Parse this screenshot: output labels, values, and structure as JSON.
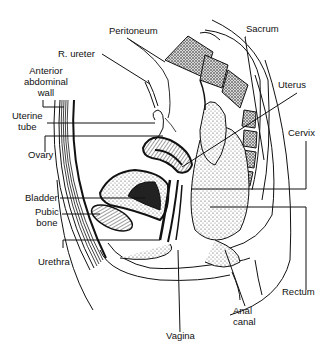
{
  "diagram": {
    "labels": {
      "peritoneum": "Peritoneum",
      "r_ureter": "R. ureter",
      "sacrum": "Sacrum",
      "anterior_abdominal_wall": [
        "Anterior",
        "abdominal",
        "wall"
      ],
      "uterus": "Uterus",
      "uterine_tube": [
        "Uterine",
        "tube"
      ],
      "cervix": "Cervix",
      "ovary": "Ovary",
      "bladder": "Bladder",
      "pubic_bone": [
        "Pubic",
        "bone"
      ],
      "urethra": "Urethra",
      "rectum": "Rectum",
      "anal_canal": [
        "Anal",
        "canal"
      ],
      "vagina": "Vagina"
    },
    "colors": {
      "ink": "#111111",
      "background": "#ffffff",
      "stipple": "#555555"
    }
  }
}
